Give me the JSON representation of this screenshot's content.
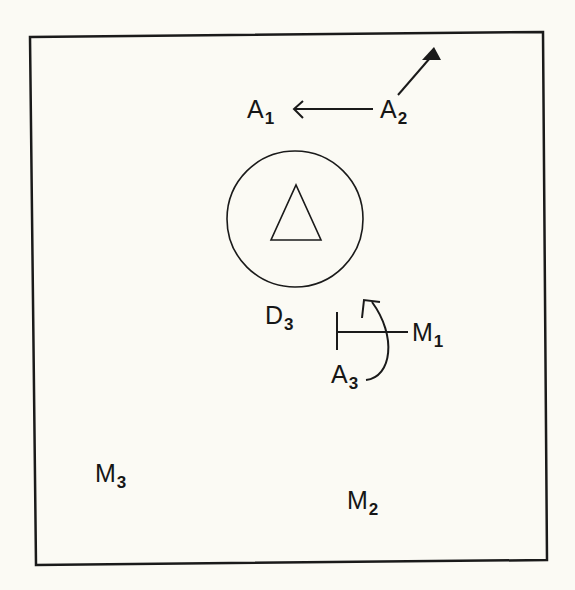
{
  "diagram": {
    "labels": {
      "a1": {
        "main": "A",
        "sub": "1"
      },
      "a2": {
        "main": "A",
        "sub": "2"
      },
      "a3": {
        "main": "A",
        "sub": "3"
      },
      "d3": {
        "main": "D",
        "sub": "3"
      },
      "m1": {
        "main": "M",
        "sub": "1"
      },
      "m2": {
        "main": "M",
        "sub": "2"
      },
      "m3": {
        "main": "M",
        "sub": "3"
      }
    },
    "colors": {
      "ink": "#161616",
      "paper": "#fbfaf4"
    }
  }
}
